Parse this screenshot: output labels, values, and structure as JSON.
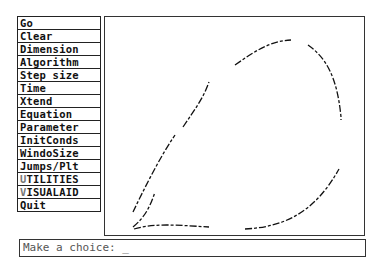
{
  "menu": {
    "items": [
      {
        "label": "Go"
      },
      {
        "label": "Clear"
      },
      {
        "label": "Dimension"
      },
      {
        "label": "Algorithm"
      },
      {
        "label": "Step size"
      },
      {
        "label": "Time"
      },
      {
        "label": "Xtend"
      },
      {
        "label": "Equation"
      },
      {
        "label": "Parameter"
      },
      {
        "label": "InitConds"
      },
      {
        "label": "WindoSize"
      },
      {
        "label": "Jumps/Plt"
      },
      {
        "first": "U",
        "rest": "TILITIES"
      },
      {
        "first": "V",
        "rest": "ISUALAID"
      },
      {
        "label": "Quit"
      }
    ]
  },
  "prompt": {
    "text": "Make a choice: _"
  }
}
